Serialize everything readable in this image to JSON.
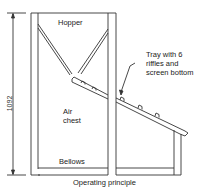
{
  "diagram": {
    "caption": "Operating principle",
    "dimension": {
      "value": "1092",
      "orientation": "vertical"
    },
    "labels": {
      "hopper": "Hopper",
      "air_chest_line1": "Air",
      "air_chest_line2": "chest",
      "bellows": "Bellows",
      "tray_line1": "Tray with 6",
      "tray_line2": "riffles and",
      "tray_line3": "screen bottom"
    },
    "colors": {
      "stroke": "#333333",
      "background": "#ffffff"
    }
  }
}
